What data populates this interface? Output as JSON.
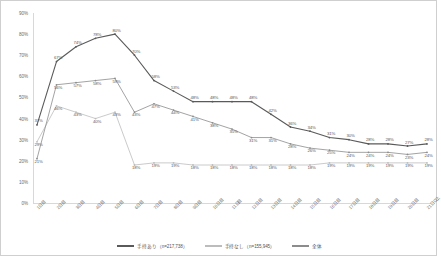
{
  "chart_data": {
    "type": "line",
    "title": "",
    "xlabel": "",
    "ylabel": "",
    "ylim": [
      0,
      90
    ],
    "ytick_labels": [
      "0%",
      "10%",
      "20%",
      "30%",
      "40%",
      "50%",
      "60%",
      "70%",
      "80%",
      "90%"
    ],
    "ytick_values": [
      0,
      10,
      20,
      30,
      40,
      50,
      60,
      70,
      80,
      90
    ],
    "grid": false,
    "legend_position": "bottom",
    "categories": [
      "1日目",
      "2日目",
      "3日目",
      "4日目",
      "5日目",
      "6日目",
      "7日目",
      "8日目",
      "9日目",
      "10日目",
      "11日目",
      "12日目",
      "13日目",
      "14日目",
      "15日目",
      "16日目",
      "17日目",
      "18日目",
      "19日目",
      "20日目",
      "21日以上"
    ],
    "series": [
      {
        "name": "手持あり",
        "legend_label": "手持あり（n=217,738）",
        "color": "#5a5a5a",
        "values": [
          37,
          67,
          74,
          78,
          80,
          70,
          58,
          53,
          48,
          48,
          48,
          48,
          42,
          36,
          34,
          31,
          30,
          28,
          28,
          27,
          28
        ],
        "data_labels": [
          "37%",
          "67%",
          "74%",
          "78%",
          "80%",
          "70%",
          "58%",
          "53%",
          "48%",
          "48%",
          "48%",
          "48%",
          "42%",
          "36%",
          "34%",
          "31%",
          "30%",
          "28%",
          "28%",
          "27%",
          "28%"
        ]
      },
      {
        "name": "手持なし",
        "legend_label": "手持なし（n=155,945）",
        "color": "#bcbcbc",
        "values": [
          29,
          46,
          43,
          40,
          43,
          18,
          19,
          19,
          18,
          18,
          18,
          18,
          18,
          18,
          18,
          19,
          19,
          19,
          19,
          19,
          19
        ],
        "data_labels": [
          "29%",
          "46%",
          "43%",
          "40%",
          "43%",
          "18%",
          "19%",
          "19%",
          "18%",
          "18%",
          "18%",
          "18%",
          "18%",
          "18%",
          "18%",
          "19%",
          "19%",
          "19%",
          "19%",
          "19%",
          "19%"
        ]
      },
      {
        "name": "全体",
        "legend_label": "全体",
        "color": "#8c8c8c",
        "values": [
          21,
          56,
          57,
          58,
          59,
          43,
          47,
          44,
          41,
          38,
          35,
          31,
          31,
          28,
          26,
          25,
          24,
          24,
          24,
          23,
          24
        ],
        "data_labels": [
          "21%",
          "56%",
          "57%",
          "58%",
          "59%",
          "43%",
          "47%",
          "44%",
          "41%",
          "38%",
          "35%",
          "31%",
          "31%",
          "28%",
          "26%",
          "25%",
          "24%",
          "24%",
          "24%",
          "23%",
          "24%"
        ]
      }
    ]
  }
}
